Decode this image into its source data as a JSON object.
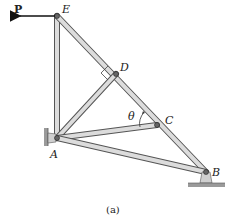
{
  "figure": {
    "caption": "(a)",
    "load": {
      "label": "P",
      "direction": "left"
    },
    "angle": {
      "label": "θ"
    },
    "joints": [
      {
        "id": "E",
        "label": "E",
        "x": 57,
        "y": 16
      },
      {
        "id": "D",
        "label": "D",
        "x": 116,
        "y": 74
      },
      {
        "id": "C",
        "label": "C",
        "x": 157,
        "y": 125
      },
      {
        "id": "A",
        "label": "A",
        "x": 57,
        "y": 138
      },
      {
        "id": "B",
        "label": "B",
        "x": 206,
        "y": 172
      }
    ],
    "members": [
      [
        "E",
        "A"
      ],
      [
        "E",
        "D"
      ],
      [
        "D",
        "C"
      ],
      [
        "C",
        "B"
      ],
      [
        "A",
        "D"
      ],
      [
        "A",
        "C"
      ],
      [
        "A",
        "B"
      ]
    ],
    "supports": [
      {
        "joint": "A",
        "type": "pin-wall"
      },
      {
        "joint": "B",
        "type": "pin-ground"
      }
    ],
    "colors": {
      "member_fill": "#d9d9d9",
      "member_stroke": "#555555",
      "ground": "#9a9a9a",
      "text": "#222222"
    }
  }
}
